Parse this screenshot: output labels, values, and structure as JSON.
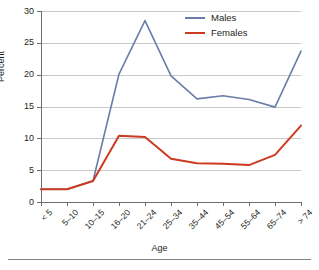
{
  "chart_data": {
    "type": "line",
    "title": "",
    "xlabel": "Age",
    "ylabel": "Percent",
    "ylim": [
      0,
      30
    ],
    "yticks": [
      0,
      5,
      10,
      15,
      20,
      25,
      30
    ],
    "grid": true,
    "legend_position": "upper-right-inside",
    "categories": [
      "< 5",
      "5–10",
      "10–15",
      "16–20",
      "21–24",
      "25–34",
      "35–44",
      "45–54",
      "55–64",
      "65–74",
      "> 74"
    ],
    "series": [
      {
        "name": "Males",
        "color": "#6b7ca8",
        "values": [
          2.0,
          2.0,
          3.3,
          20.1,
          28.5,
          19.8,
          16.2,
          16.7,
          16.1,
          14.9,
          23.7
        ]
      },
      {
        "name": "Females",
        "color": "#cc3a21",
        "values": [
          2.0,
          2.0,
          3.3,
          10.4,
          10.2,
          6.8,
          6.1,
          6.0,
          5.8,
          7.4,
          12.0
        ]
      }
    ]
  },
  "legend": {
    "items": [
      {
        "label": "Males",
        "color": "#6b7ca8"
      },
      {
        "label": "Females",
        "color": "#cc3a21"
      }
    ]
  },
  "axes": {
    "y_title": "Percent",
    "x_title": "Age",
    "y_tick_labels": [
      "0",
      "5",
      "10",
      "15",
      "20",
      "25",
      "30"
    ],
    "x_tick_labels": [
      "< 5",
      "5–10",
      "10–15",
      "16–20",
      "21–24",
      "25–34",
      "35–44",
      "45–54",
      "55–64",
      "65–74",
      "> 74"
    ]
  },
  "caption": {
    "fragment": ""
  }
}
